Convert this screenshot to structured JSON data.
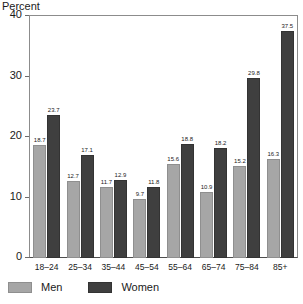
{
  "chart_data": {
    "type": "bar",
    "title": "",
    "ylabel": "Percent",
    "xlabel": "",
    "ylim": [
      0,
      40
    ],
    "yticks": [
      0,
      10,
      20,
      30,
      40
    ],
    "grid": false,
    "legend_position": "bottom-left",
    "categories": [
      "18–24",
      "25–34",
      "35–44",
      "45–54",
      "55–64",
      "65–74",
      "75–84",
      "85+"
    ],
    "series": [
      {
        "name": "Men",
        "color": "#a6a6a6",
        "values": [
          18.7,
          12.7,
          11.7,
          9.7,
          15.6,
          10.9,
          15.2,
          16.3
        ]
      },
      {
        "name": "Women",
        "color": "#3f3f3f",
        "values": [
          23.7,
          17.1,
          12.9,
          11.8,
          18.8,
          18.2,
          29.8,
          37.5
        ]
      }
    ]
  },
  "legend": {
    "items": [
      {
        "label": "Men",
        "key": "men"
      },
      {
        "label": "Women",
        "key": "women"
      }
    ]
  }
}
